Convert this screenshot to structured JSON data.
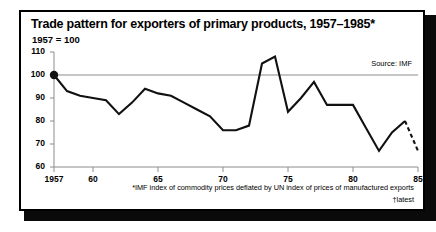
{
  "figure": {
    "title": "Trade pattern for exporters of primary products, 1957–1985*",
    "subtitle": "1957 = 100",
    "source": "Source: IMF",
    "footnote_1": "*IMF index of commodity prices deflated by UN index of prices of manufactured exports",
    "footnote_2": "†latest",
    "frame_color": "#000000",
    "line_color": "#111111",
    "gridline_color": "#8c8c8c",
    "background": "#ffffff"
  },
  "chart_data": {
    "type": "line",
    "title": "Trade pattern for exporters of primary products, 1957–1985*",
    "subtitle": "1957 = 100",
    "xlabel": "",
    "ylabel": "",
    "xlim": [
      1957,
      1985
    ],
    "ylim": [
      60,
      110
    ],
    "yticks": [
      60,
      70,
      80,
      90,
      100,
      110
    ],
    "ytick_labels": [
      "60",
      "70",
      "80",
      "90",
      "100",
      "110"
    ],
    "xticks": [
      1957,
      1960,
      1965,
      1970,
      1975,
      1980,
      1985
    ],
    "xtick_labels": [
      "1957",
      "60",
      "65",
      "70",
      "75",
      "80",
      "85"
    ],
    "grid": "horizontal reference line at 100 only",
    "legend": "none",
    "markers": [
      {
        "x": 1957,
        "y": 100,
        "style": "filled-circle",
        "note": "base year marker"
      }
    ],
    "annotations": [
      {
        "text": "Source: IMF",
        "position": "top-right inside plot"
      }
    ],
    "series": [
      {
        "name": "IMF index of commodity prices deflated by UN index of prices of manufactured exports",
        "linestyle": "solid",
        "x": [
          1957,
          1958,
          1959,
          1960,
          1961,
          1962,
          1963,
          1964,
          1965,
          1966,
          1967,
          1968,
          1969,
          1970,
          1971,
          1972,
          1973,
          1974,
          1975,
          1976,
          1977,
          1978,
          1979,
          1980,
          1981,
          1982,
          1983,
          1984
        ],
        "values": [
          100,
          93,
          91,
          90,
          89,
          83,
          88,
          94,
          92,
          91,
          88,
          85,
          82,
          76,
          76,
          78,
          105,
          108,
          84,
          90,
          97,
          87,
          87,
          87,
          77,
          67,
          75,
          80
        ]
      },
      {
        "name": "latest (provisional)",
        "linestyle": "dashed",
        "x": [
          1984,
          1985
        ],
        "values": [
          80,
          67
        ]
      }
    ]
  }
}
